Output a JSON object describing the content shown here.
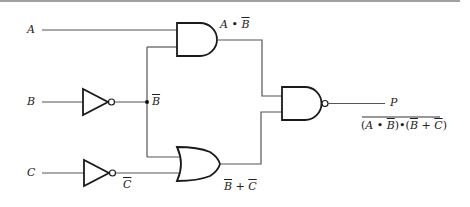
{
  "diagram": {
    "type": "logic-circuit",
    "inputs": [
      {
        "label": "A"
      },
      {
        "label": "B"
      },
      {
        "label": "C"
      }
    ],
    "inverters": [
      {
        "input": "B",
        "output_label": "B",
        "output_label_overline": true
      },
      {
        "input": "C",
        "output_label": "C",
        "output_label_overline": true
      }
    ],
    "gates": [
      {
        "type": "AND",
        "inputs": [
          "A",
          "B̄"
        ],
        "output_label": "A • B̄"
      },
      {
        "type": "OR",
        "inputs": [
          "B̄",
          "C̄"
        ],
        "output_label": "B̄ + C̄"
      },
      {
        "type": "NAND",
        "inputs": [
          "A • B̄",
          "B̄ + C̄"
        ],
        "output_label": "P"
      }
    ],
    "output": {
      "label": "P",
      "expression": "(A • B̄)•(B̄ + C̄)",
      "expression_overline": true
    },
    "labels": {
      "a": "A",
      "b": "B",
      "c": "C",
      "b_bar": "B",
      "c_bar": "C",
      "and_out_left": "A • ",
      "and_out_bar": "B",
      "or_out_b": "B",
      "or_out_plus": " + ",
      "or_out_c": "C",
      "p": "P",
      "expr_open": "(",
      "expr_a": "A",
      "expr_dot1": " • ",
      "expr_b1": "B",
      "expr_mid": ")•(",
      "expr_b2": "B",
      "expr_plus": " + ",
      "expr_c": "C",
      "expr_close": ")"
    }
  }
}
